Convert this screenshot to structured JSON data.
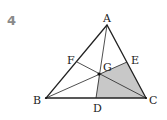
{
  "problem_number": "4",
  "diagram": {
    "type": "triangle-medians-centroid",
    "points": {
      "A": {
        "label": "A",
        "x": 107,
        "y": 25
      },
      "B": {
        "label": "B",
        "x": 46,
        "y": 98
      },
      "C": {
        "label": "C",
        "x": 146,
        "y": 98
      },
      "D": {
        "label": "D",
        "x": 96,
        "y": 98
      },
      "E": {
        "label": "E",
        "x": 127,
        "y": 62
      },
      "F": {
        "label": "F",
        "x": 77,
        "y": 62
      },
      "G": {
        "label": "G",
        "x": 99,
        "y": 74
      }
    },
    "segments": [
      "AB",
      "BC",
      "CA",
      "AD",
      "BE",
      "CF"
    ],
    "shaded_region": [
      "G",
      "E",
      "C",
      "D"
    ],
    "colors": {
      "line": "#222222",
      "shade": "#c8c8c8",
      "number": "#8a8a8a"
    }
  }
}
